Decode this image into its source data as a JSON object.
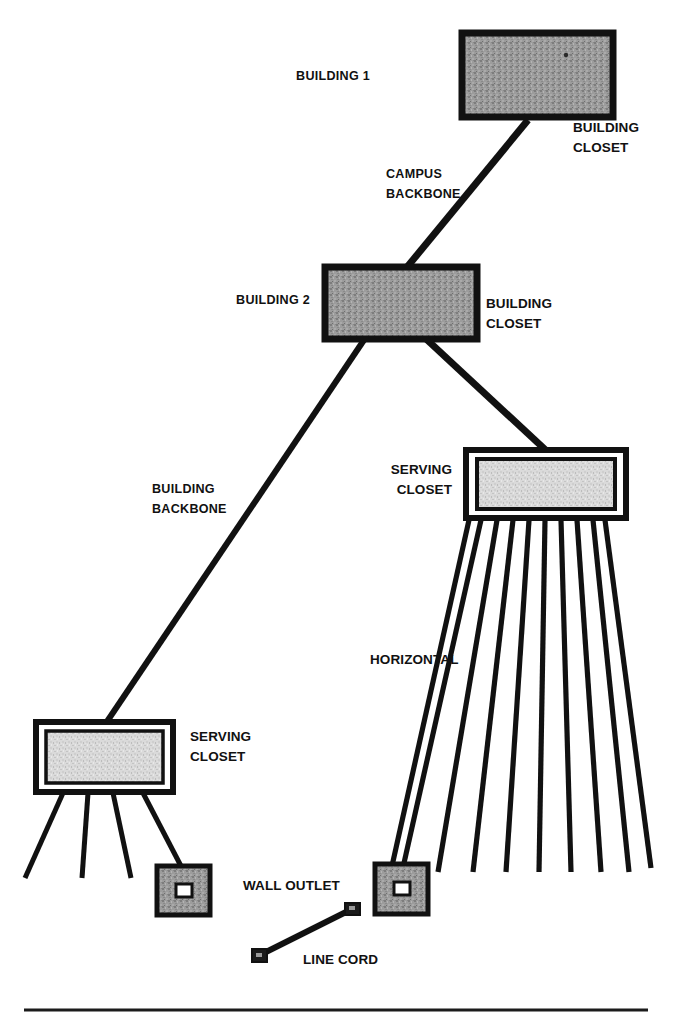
{
  "figure": {
    "type": "network-topology-diagram",
    "background_color": "#ffffff",
    "ink_color": "#111111",
    "building_fill_color": "#9a9a9a",
    "closet_fill_color": "#d8d8d8",
    "outlet_fill_color": "#9a9a9a"
  },
  "nodes": {
    "building1": {
      "label": "BUILDING 1",
      "closet_label": "BUILDING\nCLOSET",
      "shape": "filled-rectangle",
      "x": 462,
      "y": 33,
      "w": 151,
      "h": 84
    },
    "building2": {
      "label": "BUILDING 2",
      "closet_label": "BUILDING\nCLOSET",
      "shape": "filled-rectangle",
      "x": 325,
      "y": 267,
      "w": 152,
      "h": 72
    },
    "serving_closet_right": {
      "label": "SERVING\nCLOSET",
      "shape": "double-bordered-rectangle",
      "x": 466,
      "y": 450,
      "w": 160,
      "h": 68,
      "horizontal_cable_count": 10
    },
    "serving_closet_left": {
      "label": "SERVING\nCLOSET",
      "shape": "double-bordered-rectangle",
      "x": 36,
      "y": 722,
      "w": 137,
      "h": 70,
      "drop_cable_count": 4
    },
    "wall_outlet_left": {
      "label": "WALL OUTLET",
      "shape": "outlet-square",
      "x": 157,
      "y": 866,
      "w": 53,
      "h": 49
    },
    "wall_outlet_right": {
      "label": "WALL OUTLET",
      "shape": "outlet-square",
      "x": 375,
      "y": 864,
      "w": 53,
      "h": 50
    },
    "line_cord": {
      "label": "LINE CORD",
      "shape": "cord-with-connectors",
      "from_x": 258,
      "from_y": 957,
      "to_x": 352,
      "to_y": 908
    }
  },
  "links": [
    {
      "name": "campus-backbone",
      "label": "CAMPUS\nBACKBONE",
      "from": "building2",
      "to": "building1",
      "style": "thick-line"
    },
    {
      "name": "building-backbone",
      "label": "BUILDING\nBACKBONE",
      "from": "building2",
      "to": "serving_closet_left",
      "style": "thick-line"
    },
    {
      "name": "building-backbone-right",
      "label": "",
      "from": "building2",
      "to": "serving_closet_right",
      "style": "thick-line"
    },
    {
      "name": "horizontal-cabling",
      "label": "HORIZONTAL",
      "from": "serving_closet_right",
      "to": "wall_outlet_right",
      "style": "fan-of-lines"
    }
  ],
  "labels": {
    "building1": "BUILDING 1",
    "building1_closet_line1": "BUILDING",
    "building1_closet_line2": "CLOSET",
    "campus_backbone_line1": "CAMPUS",
    "campus_backbone_line2": "BACKBONE",
    "building2": "BUILDING 2",
    "building2_closet_line1": "BUILDING",
    "building2_closet_line2": "CLOSET",
    "serving_closet_right_line1": "SERVING",
    "serving_closet_right_line2": "CLOSET",
    "building_backbone_line1": "BUILDING",
    "building_backbone_line2": "BACKBONE",
    "horizontal": "HORIZONTAL",
    "serving_closet_left_line1": "SERVING",
    "serving_closet_left_line2": "CLOSET",
    "wall_outlet": "WALL OUTLET",
    "line_cord": "LINE CORD"
  }
}
